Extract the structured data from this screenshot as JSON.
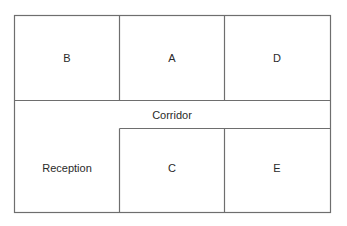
{
  "diagram": {
    "type": "floor-plan",
    "rooms": {
      "b": "B",
      "a": "A",
      "d": "D",
      "corridor": "Corridor",
      "reception": "Reception",
      "c": "C",
      "e": "E"
    },
    "colors": {
      "wall": "#6e6e6e",
      "text": "#2a2a2a",
      "background": "#ffffff"
    }
  }
}
